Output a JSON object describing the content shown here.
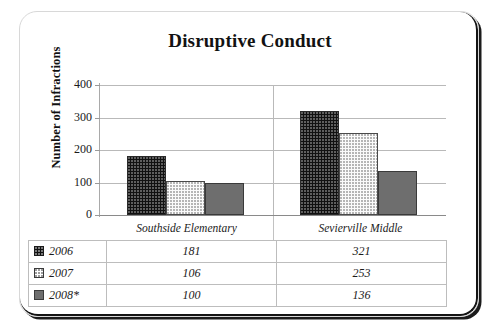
{
  "chart_data": {
    "type": "bar",
    "title": "Disruptive Conduct",
    "xlabel": "",
    "ylabel": "Number of Infractions",
    "categories": [
      "Southside Elementary",
      "Sevierville Middle"
    ],
    "series": [
      {
        "name": "2006",
        "values": [
          181,
          321
        ],
        "swatch": "black-dotted-swatch"
      },
      {
        "name": "2007",
        "values": [
          106,
          253
        ],
        "swatch": "white-dotted-swatch"
      },
      {
        "name": "2008*",
        "values": [
          100,
          136
        ],
        "swatch": "gray-solid-swatch"
      }
    ],
    "ylim": [
      0,
      400
    ],
    "yticks": [
      "0",
      "100",
      "200",
      "300",
      "400"
    ],
    "grid": true,
    "legend_position": "table-below",
    "colors": {
      "series_2006": "#111111",
      "series_2007": "#fbfbfb",
      "series_2008": "#6e6e6e",
      "gridline": "#b9b9b9",
      "text": "#1b1b1b"
    }
  },
  "table": {
    "rows": [
      {
        "year": "2006",
        "southside": "181",
        "sevierville": "321"
      },
      {
        "year": "2007",
        "southside": "106",
        "sevierville": "253"
      },
      {
        "year": "2008*",
        "southside": "100",
        "sevierville": "136"
      }
    ]
  }
}
